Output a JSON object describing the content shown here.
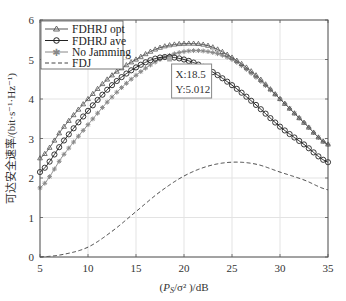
{
  "chart_data": {
    "type": "line",
    "title": "",
    "xlabel": "(P_S/σ²)/dB",
    "ylabel": "可达安全速率/(bit·s⁻¹·Hz⁻¹)",
    "xlim": [
      5,
      35
    ],
    "ylim": [
      0,
      6
    ],
    "xticks": [
      5,
      10,
      15,
      20,
      25,
      30,
      35
    ],
    "yticks": [
      0,
      1,
      2,
      3,
      4,
      5,
      6
    ],
    "grid": true,
    "legend_position": "upper-left",
    "x": [
      5,
      7.5,
      10,
      12.5,
      15,
      17.5,
      20,
      22.5,
      25,
      27.5,
      30,
      32.5,
      35
    ],
    "series": [
      {
        "name": "FDHRJ opt",
        "marker": "triangle",
        "color": "#555555",
        "line": "solid",
        "values": [
          2.5,
          3.3,
          4.0,
          4.6,
          5.0,
          5.3,
          5.4,
          5.35,
          5.05,
          4.6,
          4.0,
          3.4,
          2.85
        ]
      },
      {
        "name": "FDHRJ ave",
        "marker": "circle",
        "color": "#222222",
        "line": "solid",
        "values": [
          2.15,
          2.95,
          3.7,
          4.35,
          4.8,
          5.05,
          5.0,
          4.75,
          4.35,
          3.85,
          3.3,
          2.85,
          2.4
        ]
      },
      {
        "name": "No Jamming",
        "marker": "asterisk",
        "color": "#888888",
        "line": "solid",
        "values": [
          1.75,
          2.6,
          3.35,
          4.05,
          4.6,
          5.0,
          5.2,
          5.2,
          5.0,
          4.55,
          4.0,
          3.4,
          2.85
        ]
      },
      {
        "name": "FDJ",
        "marker": "none",
        "color": "#444444",
        "line": "dashed",
        "values": [
          0.0,
          0.07,
          0.25,
          0.65,
          1.15,
          1.65,
          2.05,
          2.3,
          2.4,
          2.35,
          2.15,
          1.95,
          1.7
        ]
      }
    ],
    "annotations": [
      {
        "type": "datatip",
        "x": 18.5,
        "y": 5.012,
        "text_x": "X:18.5",
        "text_y": "Y:5.012"
      }
    ]
  },
  "labels": {
    "xlabel_prefix": "(",
    "xlabel_P": "P",
    "xlabel_sub": "S",
    "xlabel_rest": "/σ² )/dB",
    "ylabel": "可达安全速率/(bit·s⁻¹·Hz⁻¹)",
    "legend": [
      "FDHRJ opt",
      "FDHRJ ave",
      "No Jamming",
      "FDJ"
    ],
    "tip_x": "X:18.5",
    "tip_y": "Y:5.012"
  }
}
